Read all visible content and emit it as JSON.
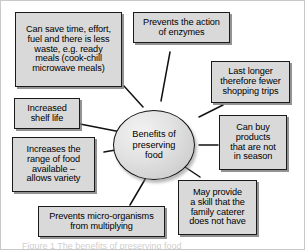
{
  "figure": {
    "type": "spider-diagram",
    "center": {
      "label": "Benefits of\npreserving\nfood"
    },
    "caption": "Figure 1 The benefits of preserving food",
    "colors": {
      "node_fill": "#d9d9d9",
      "node_border": "#1a1a1a",
      "center_fill": "#e2e2e2",
      "connector": "#111111",
      "background": "#ffffff",
      "shadow": "#787878"
    },
    "nodes": [
      {
        "id": "save-time",
        "label": "Can save time, effort,\nfuel and there is less\nwaste, e.g. ready\nmeals (cook-chill\nmicrowave meals)"
      },
      {
        "id": "enzymes",
        "label": "Prevents the action\nof enzymes"
      },
      {
        "id": "last-longer",
        "label": "Last longer\ntherefore fewer\nshopping trips"
      },
      {
        "id": "out-of-season",
        "label": "Can buy\nproducts\nthat are not\nin season"
      },
      {
        "id": "skill",
        "label": "May provide\na skill that the\nfamily caterer\ndoes not have"
      },
      {
        "id": "micro-organisms",
        "label": "Prevents micro-organisms\nfrom multiplying"
      },
      {
        "id": "range-of-food",
        "label": "Increases the\nrange of food\navailable –\nallows variety"
      },
      {
        "id": "shelf-life",
        "label": "Increased\nshelf life"
      }
    ]
  }
}
